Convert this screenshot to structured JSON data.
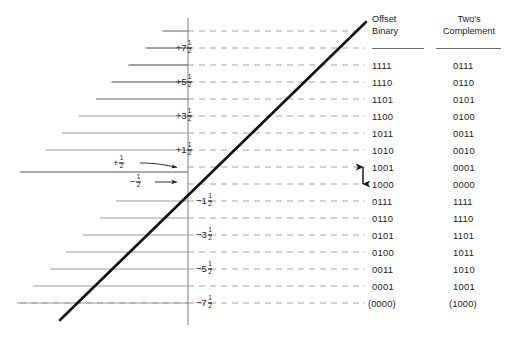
{
  "figure": {
    "kind": "quantization-transfer-function"
  },
  "chart_data": {
    "type": "line",
    "title": "",
    "xlabel": "",
    "ylabel": "",
    "grid": true,
    "legend": null,
    "axis": {
      "y_tick_labels": [
        "+7 1/2",
        "+5 1/2",
        "+3 1/2",
        "+1 1/2",
        "-1 1/2",
        "-3 1/2",
        "-5 1/2",
        "-7 1/2"
      ],
      "y_tick_values": [
        7.5,
        5.5,
        3.5,
        1.5,
        -1.5,
        -3.5,
        -5.5,
        -7.5
      ],
      "origin_labels": [
        "+1/2",
        "-1/2"
      ],
      "ylim": [
        -8.5,
        8.5
      ]
    },
    "series": [
      {
        "name": "ideal transfer characteristic",
        "type": "line",
        "x": [
          -8.5,
          8.0
        ],
        "y": [
          -8.5,
          8.0
        ]
      }
    ]
  },
  "table": {
    "headers": {
      "offset_binary": {
        "line1": "Offset",
        "line2": "Binary"
      },
      "twos_complement": {
        "line1": "Two's",
        "line2": "Complement"
      }
    },
    "rows": [
      {
        "level": "+7 1/2",
        "offset_binary": "1111",
        "twos_complement": "0111"
      },
      {
        "level": "+6 1/2",
        "offset_binary": "1110",
        "twos_complement": "0110"
      },
      {
        "level": "+5 1/2",
        "offset_binary": "1101",
        "twos_complement": "0101"
      },
      {
        "level": "+4 1/2",
        "offset_binary": "1100",
        "twos_complement": "0100"
      },
      {
        "level": "+3 1/2",
        "offset_binary": "1011",
        "twos_complement": "0011"
      },
      {
        "level": "+2 1/2",
        "offset_binary": "1010",
        "twos_complement": "0010"
      },
      {
        "level": "+1 1/2",
        "offset_binary": "1001",
        "twos_complement": "0001"
      },
      {
        "level": "+1/2",
        "offset_binary": "1000",
        "twos_complement": "0000"
      },
      {
        "level": "-1/2",
        "offset_binary": "0111",
        "twos_complement": "1111"
      },
      {
        "level": "-1 1/2",
        "offset_binary": "0110",
        "twos_complement": "1110"
      },
      {
        "level": "-2 1/2",
        "offset_binary": "0101",
        "twos_complement": "1101"
      },
      {
        "level": "-3 1/2",
        "offset_binary": "0100",
        "twos_complement": "1011"
      },
      {
        "level": "-5 1/2",
        "offset_binary": "0011",
        "twos_complement": "1010"
      },
      {
        "level": "-6 1/2",
        "offset_binary": "0001",
        "twos_complement": "1001"
      },
      {
        "level": "-7 1/2",
        "offset_binary": "(0000)",
        "twos_complement": "(1000)"
      }
    ]
  },
  "axis_labels": [
    {
      "whole": "+7",
      "num": "1",
      "den": "2"
    },
    {
      "whole": "+5",
      "num": "1",
      "den": "2"
    },
    {
      "whole": "+3",
      "num": "1",
      "den": "2"
    },
    {
      "whole": "+1",
      "num": "1",
      "den": "2"
    },
    {
      "whole": "−1",
      "num": "1",
      "den": "2"
    },
    {
      "whole": "−3",
      "num": "1",
      "den": "2"
    },
    {
      "whole": "−5",
      "num": "1",
      "den": "2"
    },
    {
      "whole": "−7",
      "num": "1",
      "den": "2"
    }
  ],
  "origin_annotations": [
    {
      "sign": "+",
      "num": "1",
      "den": "2"
    },
    {
      "sign": "−",
      "num": "1",
      "den": "2"
    }
  ],
  "colors": {
    "ink": "#1a1a1a",
    "curve": "#111111",
    "axis": "#8a8a8a",
    "gridline": "#8e8e8e",
    "dashed": "#9a9a9a",
    "background": "#ffffff"
  }
}
